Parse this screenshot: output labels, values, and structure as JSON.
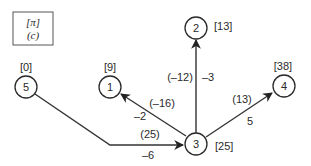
{
  "legend": {
    "line1": "[π]",
    "line2": "(c)"
  },
  "nodes": [
    {
      "id": "1",
      "label": "1",
      "potential": "[9]"
    },
    {
      "id": "2",
      "label": "2",
      "potential": "[13]"
    },
    {
      "id": "3",
      "label": "3",
      "potential": "[25]"
    },
    {
      "id": "4",
      "label": "4",
      "potential": "[38]"
    },
    {
      "id": "5",
      "label": "5",
      "potential": "[0]"
    }
  ],
  "edges": [
    {
      "from": "5",
      "to": "3",
      "reduced_cost": "(25)",
      "cost": "–6"
    },
    {
      "from": "3",
      "to": "1",
      "reduced_cost": "(–16)",
      "cost": "–2"
    },
    {
      "from": "3",
      "to": "2",
      "reduced_cost": "(–12)",
      "cost": "–3"
    },
    {
      "from": "3",
      "to": "4",
      "reduced_cost": "(13)",
      "cost": "5"
    }
  ],
  "colors": {
    "stroke": "#2a2a2a",
    "background": "#ffffff"
  }
}
